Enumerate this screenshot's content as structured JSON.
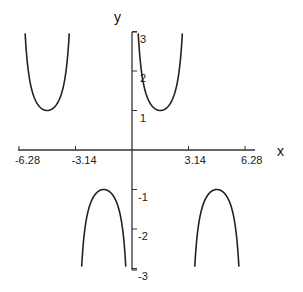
{
  "chart_data": {
    "type": "line",
    "title": "",
    "function": "y = csc(x)",
    "xlabel": "x",
    "ylabel": "y",
    "xlim": [
      -7.0,
      6.7
    ],
    "ylim": [
      -3,
      3
    ],
    "x_ticks": [
      {
        "value": -6.28,
        "label": "-6.28"
      },
      {
        "value": -3.14,
        "label": "-3.14"
      },
      {
        "value": 3.14,
        "label": "3.14"
      },
      {
        "value": 6.28,
        "label": "6.28"
      }
    ],
    "y_ticks": [
      {
        "value": 3,
        "label": "3"
      },
      {
        "value": 2,
        "label": "2"
      },
      {
        "value": 1,
        "label": "1"
      },
      {
        "value": -1,
        "label": "-1"
      },
      {
        "value": -2,
        "label": "-2"
      },
      {
        "value": -3,
        "label": "-3"
      }
    ],
    "series": [
      {
        "name": "branch (-2π,-π)",
        "domain": [
          -6.2832,
          -3.1416
        ],
        "extremum": {
          "x": -4.712,
          "y": 1
        }
      },
      {
        "name": "branch (-π,0)",
        "domain": [
          -3.1416,
          0
        ],
        "extremum": {
          "x": -1.571,
          "y": -1
        }
      },
      {
        "name": "branch (0,π)",
        "domain": [
          0,
          3.1416
        ],
        "extremum": {
          "x": 1.571,
          "y": 1
        }
      },
      {
        "name": "branch (π,2π)",
        "domain": [
          3.1416,
          6.2832
        ],
        "extremum": {
          "x": 4.712,
          "y": -1
        }
      }
    ],
    "clip_abs_y": 3.05,
    "grid": false,
    "legend": "none",
    "line_color": "#222222"
  }
}
